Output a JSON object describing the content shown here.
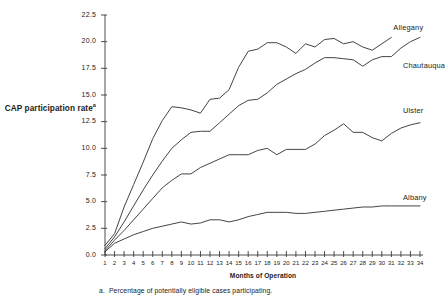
{
  "chart_data": {
    "type": "line",
    "title": "",
    "xlabel": "Months of Operation",
    "ylabel": "CAP participation rate",
    "ylabel_superscript": "a",
    "footnote_marker": "a.",
    "footnote_text": "Percentage of potentially eligible cases participating.",
    "grid": false,
    "legend_position": "inline-right-end-labels",
    "xlim": [
      1,
      34
    ],
    "ylim": [
      0.0,
      22.5
    ],
    "yticks": [
      "0.0",
      "2.5",
      "5.0",
      "7.5",
      "10.0",
      "12.5",
      "15.0",
      "17.5",
      "20.0",
      "22.5"
    ],
    "ytick_values": [
      0.0,
      2.5,
      5.0,
      7.5,
      10.0,
      12.5,
      15.0,
      17.5,
      20.0,
      22.5
    ],
    "x": [
      1,
      2,
      3,
      4,
      5,
      6,
      7,
      8,
      9,
      10,
      11,
      12,
      13,
      14,
      15,
      16,
      17,
      18,
      19,
      20,
      21,
      22,
      23,
      24,
      25,
      26,
      27,
      28,
      29,
      30,
      31,
      32,
      33,
      34
    ],
    "xtick_labels": [
      "1",
      "2",
      "3",
      "4",
      "5",
      "6",
      "7",
      "8",
      "9",
      "10",
      "11",
      "12",
      "13",
      "14",
      "15",
      "16",
      "17",
      "18",
      "19",
      "20",
      "21",
      "22",
      "23",
      "24",
      "25",
      "26",
      "27",
      "28",
      "29",
      "30",
      "31",
      "32",
      "33",
      "34"
    ],
    "line_color": "#3a3a3a",
    "series": [
      {
        "name": "Allegany",
        "label_x": 31,
        "label_y": 21.3,
        "values": [
          0.9,
          2.0,
          4.5,
          6.6,
          8.7,
          10.9,
          12.6,
          13.9,
          13.8,
          13.6,
          13.3,
          14.6,
          14.7,
          15.5,
          17.6,
          19.1,
          19.3,
          19.9,
          19.9,
          19.5,
          18.9,
          19.8,
          19.5,
          20.2,
          20.3,
          19.8,
          20.0,
          19.5,
          19.2,
          19.8,
          20.4,
          null,
          null,
          null
        ]
      },
      {
        "name": "Chautauqua",
        "label_x": 32,
        "label_y": 17.7,
        "values": [
          0.6,
          1.7,
          3.1,
          4.6,
          6.1,
          7.5,
          8.8,
          10.0,
          10.8,
          11.5,
          11.6,
          11.6,
          12.4,
          13.2,
          14.0,
          14.5,
          14.6,
          15.2,
          16.0,
          16.5,
          17.0,
          17.4,
          18.0,
          18.5,
          18.5,
          18.4,
          18.3,
          17.7,
          18.3,
          18.6,
          18.6,
          19.4,
          20.0,
          20.4
        ]
      },
      {
        "name": "Ulster",
        "label_x": 32,
        "label_y": 13.5,
        "values": [
          0.4,
          1.4,
          2.3,
          3.3,
          4.3,
          5.3,
          6.3,
          7.0,
          7.6,
          7.6,
          8.2,
          8.6,
          9.0,
          9.4,
          9.4,
          9.4,
          9.8,
          10.0,
          9.4,
          9.9,
          9.9,
          9.9,
          10.4,
          11.2,
          11.7,
          12.3,
          11.5,
          11.5,
          11.0,
          10.7,
          11.4,
          11.9,
          12.2,
          12.4
        ]
      },
      {
        "name": "Albany",
        "label_x": 32,
        "label_y": 5.3,
        "values": [
          0.3,
          1.1,
          1.5,
          1.9,
          2.2,
          2.5,
          2.7,
          2.9,
          3.1,
          2.9,
          3.0,
          3.3,
          3.3,
          3.1,
          3.3,
          3.6,
          3.8,
          4.0,
          4.0,
          4.0,
          3.9,
          3.9,
          4.0,
          4.1,
          4.2,
          4.3,
          4.4,
          4.5,
          4.5,
          4.6,
          4.6,
          4.6,
          4.6,
          4.6
        ]
      }
    ]
  }
}
